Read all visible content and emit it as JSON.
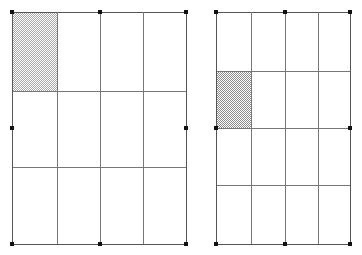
{
  "canvas": {
    "width": 362,
    "height": 255,
    "background_color": "#ffffff",
    "title": "Two rectangular grid diagrams with one shaded cell each"
  },
  "style": {
    "grid_line_color": "#777777",
    "outer_border_color": "#555555",
    "handle_color": "#111111",
    "shade_fill_dark": "#8c8c8c",
    "shade_fill_light": "#a8a8a8",
    "line_width_px": 1,
    "handle_size_px": 4
  },
  "figures": [
    {
      "id": "left-grid",
      "name": "left-grid-figure",
      "label": "Left grid",
      "bounds": {
        "x": 12,
        "y": 12,
        "width": 174,
        "height": 232
      },
      "columns": 4,
      "rows": 3,
      "column_x": [
        12,
        57,
        100,
        143,
        186
      ],
      "row_y": [
        12,
        91,
        167,
        244
      ],
      "column_widths": [
        45,
        43,
        43,
        43
      ],
      "row_heights": [
        79,
        76,
        77
      ],
      "shaded_cells": [
        {
          "row": 1,
          "column": 1,
          "x": 12,
          "y": 12,
          "width": 45,
          "height": 79,
          "fill": "checkerboard-dither",
          "tone": "light"
        }
      ],
      "handles": [
        {
          "position": "top-left",
          "x": 12,
          "y": 12
        },
        {
          "position": "top-center",
          "x": 100,
          "y": 12
        },
        {
          "position": "top-right",
          "x": 186,
          "y": 12
        },
        {
          "position": "middle-left",
          "x": 12,
          "y": 128
        },
        {
          "position": "middle-right",
          "x": 186,
          "y": 128
        },
        {
          "position": "bottom-left",
          "x": 12,
          "y": 244
        },
        {
          "position": "bottom-center",
          "x": 100,
          "y": 244
        },
        {
          "position": "bottom-right",
          "x": 186,
          "y": 244
        }
      ]
    },
    {
      "id": "right-grid",
      "name": "right-grid-figure",
      "label": "Right grid",
      "bounds": {
        "x": 216,
        "y": 12,
        "width": 134,
        "height": 232
      },
      "columns": 4,
      "rows": 4,
      "column_x": [
        216,
        251,
        285,
        318,
        350
      ],
      "row_y": [
        12,
        71,
        128,
        185,
        244
      ],
      "column_widths": [
        35,
        34,
        33,
        32
      ],
      "row_heights": [
        59,
        57,
        57,
        59
      ],
      "shaded_cells": [
        {
          "row": 2,
          "column": 1,
          "x": 216,
          "y": 71,
          "width": 35,
          "height": 57,
          "fill": "checkerboard-dither",
          "tone": "dark"
        }
      ],
      "handles": [
        {
          "position": "top-left",
          "x": 216,
          "y": 12
        },
        {
          "position": "top-center",
          "x": 285,
          "y": 12
        },
        {
          "position": "top-right",
          "x": 350,
          "y": 12
        },
        {
          "position": "middle-left",
          "x": 216,
          "y": 128
        },
        {
          "position": "middle-right",
          "x": 350,
          "y": 128
        },
        {
          "position": "bottom-left",
          "x": 216,
          "y": 244
        },
        {
          "position": "bottom-center",
          "x": 285,
          "y": 244
        },
        {
          "position": "bottom-right",
          "x": 350,
          "y": 244
        }
      ]
    }
  ]
}
